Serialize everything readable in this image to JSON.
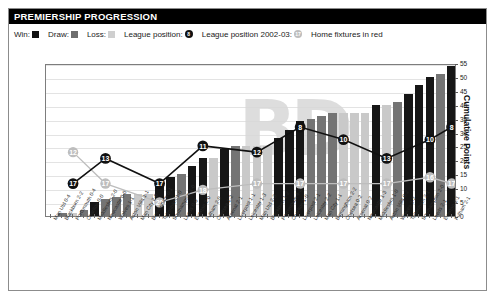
{
  "header": {
    "title": "PREMIERSHIP PROGRESSION"
  },
  "legend": {
    "win_label": "Win:",
    "draw_label": "Draw:",
    "loss_label": "Loss:",
    "position_label": "League position:",
    "position_badge": "8",
    "position_prev_label": "League position 2002-03:",
    "position_prev_badge": "17",
    "home_note": "Home fixtures in red",
    "win_color": "#161616",
    "draw_color": "#747474",
    "loss_color": "#c9c9c9",
    "position_color": "#111111",
    "position_prev_color": "#bdbdbd"
  },
  "chart_data": {
    "type": "bar",
    "title": "PREMIERSHIP PROGRESSION",
    "xlabel": "",
    "ylabel": "Cumulative Points",
    "ylim": [
      0,
      55
    ],
    "yticks": [
      0,
      5,
      10,
      15,
      20,
      25,
      30,
      35,
      40,
      45,
      50,
      55
    ],
    "grid": true,
    "legend_position": "top",
    "categories": [
      "Man Utd 0-4",
      "Blackburn 2-2",
      "Portsmouth 0-4",
      "Charlton 0-0",
      "Middlesbro 2-0",
      "Newcastle 0-0",
      "Wolves 1-1",
      "Aston Villa 1-1",
      "Man City 2-6",
      "Birmingham 0-1",
      "Tottenham 1-0",
      "Southampton 1-0",
      "Leeds 0-0",
      "Everton 2-0",
      "Fulham 2-0",
      "Chelsea 1-2",
      "Arsenal 2-1",
      "Liverpool 1-1",
      "Leicester 1-3",
      "Man Utd 2-3",
      "Blackburn 1-2",
      "Portsmouth 4-3",
      "Charlton 1-0",
      "Liverpool 2-1",
      "Leicester 2-2",
      "Man City 1-1",
      "Birmingham 2-2",
      "Chelsea 0-2",
      "Arsenal 0-2",
      "Newcastle 1-3",
      "Middlesbro 1-0",
      "Aston Villa 0-2",
      "Wolves 2-2",
      "Tottenham 2-1",
      "Southampton 2-0",
      "Leeds 2-1",
      "Everton 1-1",
      "Fulham 2-1"
    ],
    "results": [
      "loss",
      "draw",
      "loss",
      "draw",
      "win",
      "draw",
      "draw",
      "draw",
      "loss",
      "loss",
      "win",
      "win",
      "draw",
      "win",
      "win",
      "loss",
      "win",
      "draw",
      "loss",
      "loss",
      "loss",
      "win",
      "win",
      "win",
      "draw",
      "draw",
      "draw",
      "loss",
      "loss",
      "loss",
      "win",
      "loss",
      "draw",
      "win",
      "win",
      "win",
      "draw",
      "win"
    ],
    "cumulative_points": [
      0,
      1,
      1,
      2,
      5,
      6,
      7,
      8,
      8,
      8,
      11,
      14,
      15,
      18,
      21,
      21,
      24,
      25,
      25,
      25,
      25,
      28,
      31,
      34,
      35,
      36,
      37,
      37,
      37,
      37,
      40,
      40,
      41,
      44,
      47,
      50,
      51,
      54
    ],
    "league_position": {
      "name": "League position",
      "color": "#111111",
      "points": [
        {
          "index": 2,
          "value": 17
        },
        {
          "index": 5,
          "value": 13
        },
        {
          "index": 10,
          "value": 17
        },
        {
          "index": 14,
          "value": 11
        },
        {
          "index": 19,
          "value": 12
        },
        {
          "index": 23,
          "value": 8
        },
        {
          "index": 27,
          "value": 10
        },
        {
          "index": 31,
          "value": 13
        },
        {
          "index": 35,
          "value": 10
        },
        {
          "index": 37,
          "value": 8
        }
      ]
    },
    "league_position_2002_03": {
      "name": "League position 2002-03",
      "color": "#bdbdbd",
      "points": [
        {
          "index": 2,
          "value": 12
        },
        {
          "index": 5,
          "value": 17
        },
        {
          "index": 10,
          "value": 20
        },
        {
          "index": 14,
          "value": 18
        },
        {
          "index": 19,
          "value": 17
        },
        {
          "index": 23,
          "value": 17
        },
        {
          "index": 27,
          "value": 17
        },
        {
          "index": 31,
          "value": 17
        },
        {
          "index": 35,
          "value": 16
        },
        {
          "index": 37,
          "value": 17
        }
      ]
    }
  }
}
